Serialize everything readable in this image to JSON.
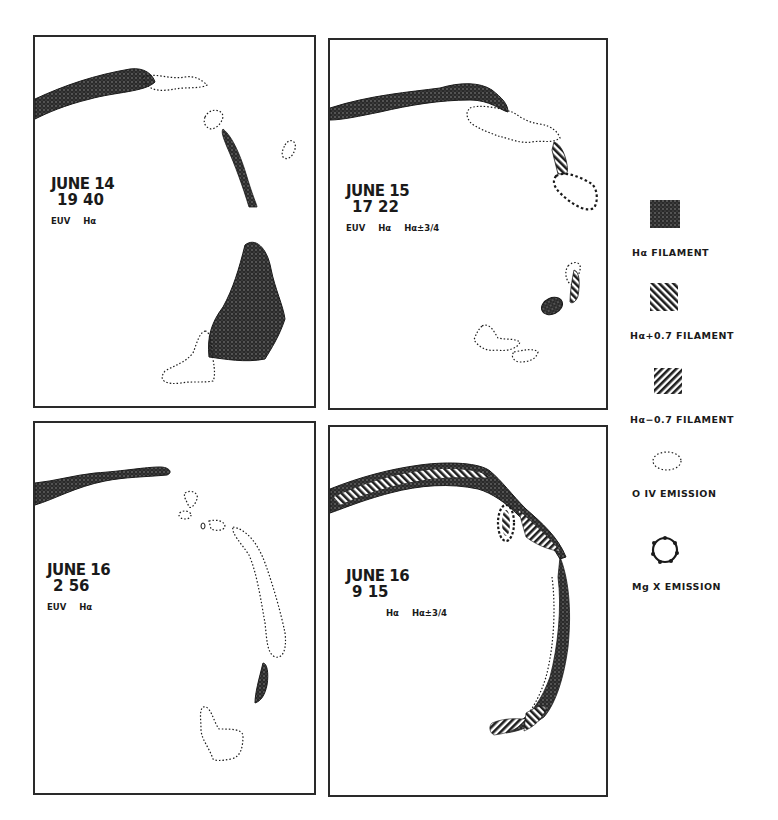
{
  "figure": {
    "panels": [
      {
        "id": "p1",
        "date": "JUNE 14",
        "time": "19 40",
        "observations": "EUV  Hα"
      },
      {
        "id": "p2",
        "date": "JUNE 15",
        "time": "17 22",
        "observations": "EUV  Hα  Hα±3/4"
      },
      {
        "id": "p3",
        "date": "JUNE 16",
        "time": "2 56",
        "observations": "EUV  Hα"
      },
      {
        "id": "p4",
        "date": "JUNE 16",
        "time": "9 15",
        "observations": "Hα  Hα±3/4"
      }
    ],
    "legend": [
      {
        "symbol": "dense-crosshatch-square",
        "label": "Hα FILAMENT"
      },
      {
        "symbol": "diagonal-hatch-square",
        "label": "Hα+0.7 FILAMENT"
      },
      {
        "symbol": "reverse-diagonal-hatch-square",
        "label": "Hα−0.7 FILAMENT"
      },
      {
        "symbol": "dotted-ellipse",
        "label": "O IV EMISSION"
      },
      {
        "symbol": "beaded-circle",
        "label": "Mg X EMISSION"
      }
    ],
    "colors": {
      "ink": "#1a1a1a",
      "paper": "#ffffff"
    }
  }
}
